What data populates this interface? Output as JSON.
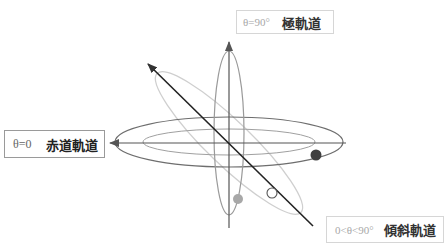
{
  "diagram": {
    "labels": {
      "polar": {
        "equation": "θ=90°",
        "name": "極軌道"
      },
      "equatorial": {
        "equation": "θ=0",
        "name": "赤道軌道"
      },
      "inclined": {
        "equation": "0<θ<90°",
        "name": "傾斜軌道"
      }
    },
    "satellites": [
      {
        "orbit": "equatorial",
        "style": "filled-dark",
        "color": "#404040"
      },
      {
        "orbit": "polar",
        "style": "filled-light",
        "color": "#a8a8a8"
      },
      {
        "orbit": "inclined",
        "style": "hollow",
        "color": "#ffffff"
      }
    ],
    "colors": {
      "axis": "#333333",
      "equatorial_orbit": "#6e6e6e",
      "polar_orbit": "#9a9a9a",
      "inclined_orbit": "#c8c8c8"
    }
  }
}
